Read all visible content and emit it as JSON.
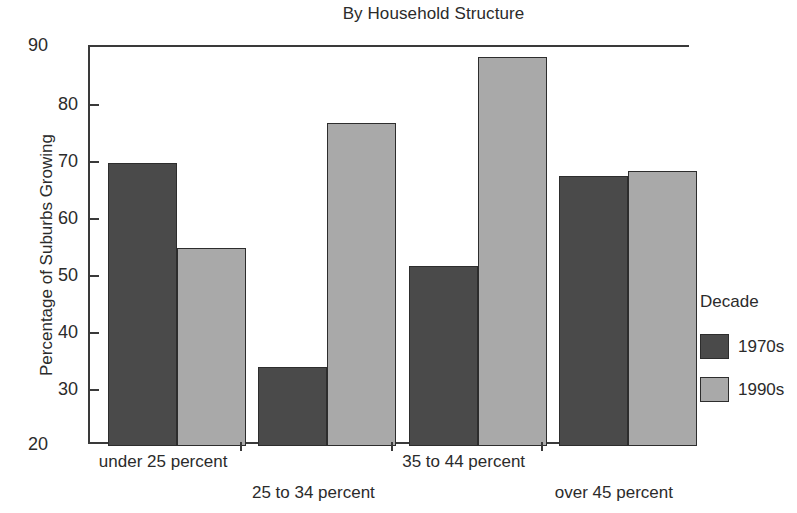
{
  "chart_data": {
    "type": "bar",
    "title": "By Household Structure",
    "xlabel": "",
    "ylabel": "Percentage of Suburbs Growing",
    "categories": [
      "under 25 percent",
      "25 to 34 percent",
      "35 to 44 percent",
      "over 45 percent"
    ],
    "series": [
      {
        "name": "1970s",
        "color": "#4a4a4a",
        "values": [
          69.7,
          33.9,
          51.5,
          67.3
        ]
      },
      {
        "name": "1990s",
        "color": "#a9a9a9",
        "values": [
          54.8,
          76.6,
          88.3,
          68.3
        ]
      }
    ],
    "ylim": [
      20,
      90
    ],
    "yticks": [
      20,
      30,
      40,
      50,
      60,
      70,
      80,
      90
    ],
    "ytick_labels": [
      "20",
      "30",
      "40",
      "50",
      "60",
      "70",
      "80",
      "90"
    ],
    "grid": false,
    "legend": {
      "title": "Decade",
      "position": "right",
      "entries": [
        "1970s",
        "1990s"
      ]
    }
  }
}
